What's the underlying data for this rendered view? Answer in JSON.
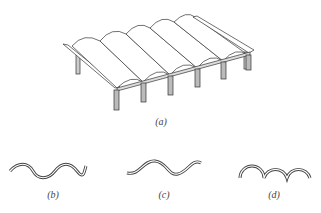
{
  "figure": {
    "panels": [
      {
        "id": "a",
        "label": "(a)",
        "description": "isometric view of roof of repeated barrel vaults on columns"
      },
      {
        "id": "b",
        "label": "(b)",
        "description": "sinusoidal corrugated section profile"
      },
      {
        "id": "c",
        "label": "(c)",
        "description": "deeper wave section profile"
      },
      {
        "id": "d",
        "label": "(d)",
        "description": "semicircular arch section profile"
      }
    ],
    "colors": {
      "line": "#333333",
      "fill": "#ffffff",
      "column": "#bbbbbb"
    }
  }
}
